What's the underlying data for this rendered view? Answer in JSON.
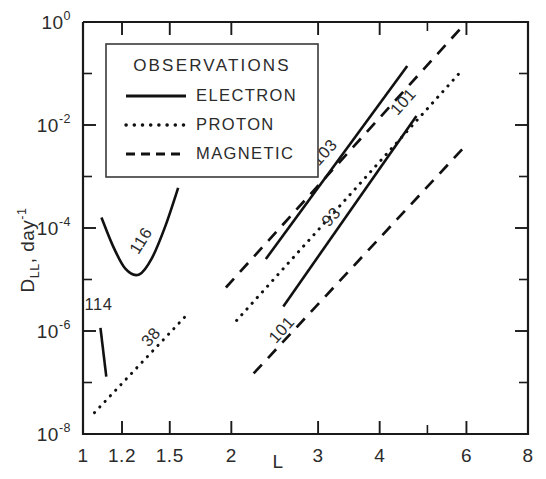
{
  "figure": {
    "title": "",
    "background_color": "#ffffff",
    "ink_color": "#111111"
  },
  "legend": {
    "title": "OBSERVATIONS",
    "position": "upper-left-inside",
    "entries": [
      {
        "label": "ELECTRON",
        "style": "solid"
      },
      {
        "label": "PROTON",
        "style": "dotted"
      },
      {
        "label": "MAGNETIC",
        "style": "dashed"
      }
    ]
  },
  "axes": {
    "x": {
      "label": "L",
      "scale": "log",
      "range": [
        1,
        8
      ],
      "tick_values": [
        1,
        1.2,
        1.5,
        2,
        3,
        4,
        6,
        8
      ],
      "tick_labels": [
        "1",
        "1.2",
        "1.5",
        "2",
        "3",
        "4",
        "6",
        "8"
      ],
      "minor_ticks": [
        5
      ]
    },
    "y": {
      "label": "D_LL , day^-1",
      "label_mantissa": "D",
      "label_subscript": "LL",
      "label_rest": ", day",
      "label_superscript": "-1",
      "scale": "log",
      "range": [
        1e-08,
        1
      ],
      "tick_exponents": [
        0,
        -2,
        -4,
        -6,
        -8
      ],
      "tick_labels": [
        "10^0",
        "10^-2",
        "10^-4",
        "10^-6",
        "10^-8"
      ],
      "minor_tick_exponents": [
        -1,
        -3,
        -5,
        -7
      ]
    }
  },
  "chart_data": {
    "type": "line",
    "title": "",
    "xlabel": "L",
    "ylabel": "D_LL , day^-1",
    "xscale": "log",
    "yscale": "log",
    "xlim": [
      1,
      8
    ],
    "ylim": [
      1e-08,
      1
    ],
    "grid": false,
    "legend_position": "upper-left",
    "legend_title": "OBSERVATIONS",
    "series": [
      {
        "name": "116",
        "label": "116",
        "style": "solid",
        "observation": "ELECTRON",
        "label_x": 1.34,
        "label_y": 5e-05,
        "label_rotation": -58,
        "points": [
          {
            "x": 1.09,
            "y": 0.00016
          },
          {
            "x": 1.15,
            "y": 4.5e-05
          },
          {
            "x": 1.22,
            "y": 1.6e-05
          },
          {
            "x": 1.3,
            "y": 1.25e-05
          },
          {
            "x": 1.38,
            "y": 2.6e-05
          },
          {
            "x": 1.47,
            "y": 0.00011
          },
          {
            "x": 1.56,
            "y": 0.0006
          }
        ]
      },
      {
        "name": "114",
        "label": "114",
        "style": "solid",
        "observation": "ELECTRON",
        "label_x": 1.075,
        "label_y": 2.6e-06,
        "label_rotation": 0,
        "points": [
          {
            "x": 1.085,
            "y": 1.15e-06
          },
          {
            "x": 1.115,
            "y": 1.3e-07
          }
        ]
      },
      {
        "name": "38",
        "label": "38",
        "style": "dotted",
        "observation": "PROTON",
        "label_x": 1.4,
        "label_y": 6.5e-07,
        "label_rotation": -48,
        "points": [
          {
            "x": 1.055,
            "y": 2.6e-08
          },
          {
            "x": 1.62,
            "y": 2e-06
          }
        ]
      },
      {
        "name": "103",
        "label": "103",
        "style": "dashed",
        "observation": "MAGNETIC",
        "label_x": 3.15,
        "label_y": 0.0025,
        "label_rotation": -48,
        "points": [
          {
            "x": 1.95,
            "y": 7e-06
          },
          {
            "x": 6.0,
            "y": 1.0
          }
        ]
      },
      {
        "name": "70",
        "label": "70",
        "style": "solid",
        "observation": "ELECTRON",
        "label_x": 2.85,
        "label_y": 0.0012,
        "label_rotation": -48,
        "points": [
          {
            "x": 2.35,
            "y": 2.5e-05
          },
          {
            "x": 4.55,
            "y": 0.14
          }
        ]
      },
      {
        "name": "101",
        "label": "101",
        "style": "dotted",
        "observation": "PROTON",
        "label_x": 4.55,
        "label_y": 0.024,
        "label_rotation": -48,
        "points": [
          {
            "x": 2.05,
            "y": 1.6e-06
          },
          {
            "x": 5.85,
            "y": 0.11
          }
        ]
      },
      {
        "name": "93",
        "label": "93",
        "style": "solid",
        "observation": "ELECTRON",
        "label_x": 3.25,
        "label_y": 0.00014,
        "label_rotation": -48,
        "points": [
          {
            "x": 2.55,
            "y": 3e-06
          },
          {
            "x": 4.75,
            "y": 0.015
          }
        ]
      },
      {
        "name": "101b",
        "label": "101",
        "style": "dashed",
        "observation": "MAGNETIC",
        "label_x": 2.58,
        "label_y": 9e-07,
        "label_rotation": -48,
        "points": [
          {
            "x": 2.22,
            "y": 1.5e-07
          },
          {
            "x": 6.05,
            "y": 0.0045
          }
        ]
      }
    ]
  }
}
